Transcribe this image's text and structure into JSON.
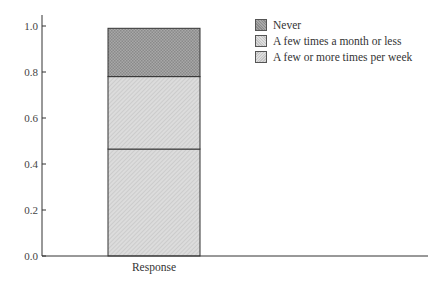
{
  "chart_data": {
    "type": "bar",
    "stacked": true,
    "title": "",
    "xlabel": "",
    "ylabel": "",
    "categories": [
      "Response"
    ],
    "series": [
      {
        "name": "A few or more times per week",
        "values": [
          0.465
        ],
        "color": "#d2d2d2"
      },
      {
        "name": "A few times a month or less",
        "values": [
          0.315
        ],
        "color": "#d2d2d2"
      },
      {
        "name": "Never",
        "values": [
          0.21
        ],
        "color": "#9a9a9a"
      }
    ],
    "ylim": [
      0.0,
      1.05
    ],
    "yticks": [
      "0.0",
      "0.2",
      "0.4",
      "0.6",
      "0.8",
      "1.0"
    ],
    "grid": false,
    "legend_position": "upper right (outside plot)"
  },
  "legend": {
    "items": [
      {
        "label": "Never",
        "color": "#9a9a9a"
      },
      {
        "label": "A few times a month or less",
        "color": "#d2d2d2"
      },
      {
        "label": "A few or more times per week",
        "color": "#d2d2d2"
      }
    ]
  },
  "axis": {
    "x_category_label": "Response"
  }
}
